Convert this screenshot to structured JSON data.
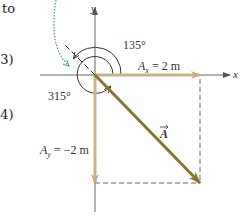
{
  "margin_text": {
    "line1": "to",
    "line2": ".3)",
    "line3": ".4)"
  },
  "axes": {
    "x_label": "x",
    "y_label": "y"
  },
  "components": {
    "ax_symbol": "A",
    "ax_sub": "x",
    "ax_value": " = 2 m",
    "ay_symbol": "A",
    "ay_sub": "y",
    "ay_value": " = −2 m"
  },
  "vector": {
    "label": "A"
  },
  "angles": {
    "angle1": "135°",
    "angle2": "315°"
  },
  "colors": {
    "component_arrow": "#c8b48a",
    "vector_arrow": "#8a7332",
    "axis": "#555555",
    "dotted_arrow": "#4a90c8"
  }
}
